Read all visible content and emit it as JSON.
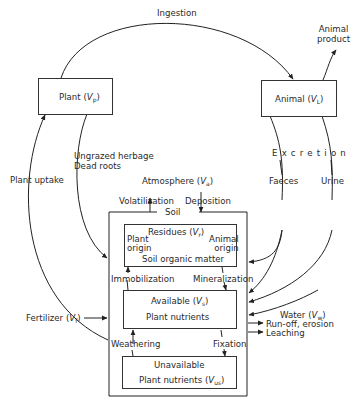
{
  "diagram": {
    "nodes": {
      "plant": {
        "label": "Plant",
        "symbol": "V",
        "subscript": "p"
      },
      "animal": {
        "label": "Animal",
        "symbol": "V",
        "subscript": "L"
      },
      "atmosphere": {
        "label": "Atmosphere",
        "symbol": "V",
        "subscript": "a"
      },
      "soil": {
        "label": "Soil"
      },
      "residues": {
        "label": "Residues",
        "symbol": "V",
        "subscript": "r",
        "plant_origin_1": "Plant",
        "plant_origin_2": "origin",
        "animal_origin_1": "Animal",
        "animal_origin_2": "origin",
        "soil_organic_matter": "Soil organic matter"
      },
      "available": {
        "label": "Available",
        "symbol": "V",
        "subscript": "s",
        "line2": "Plant nutrients"
      },
      "unavailable": {
        "label": "Unavailable",
        "line2": "Plant nutrients",
        "symbol": "V",
        "subscript": "us"
      },
      "fertilizer": {
        "label": "Fertilizer",
        "symbol": "V",
        "subscript": "f"
      },
      "water": {
        "label": "Water",
        "symbol": "V",
        "subscript": "w"
      },
      "animal_product": {
        "line1": "Animal",
        "line2": "product"
      }
    },
    "flows": {
      "ingestion": "Ingestion",
      "plant_uptake": "Plant uptake",
      "ungrazed_herbage": "Ungrazed herbage",
      "dead_roots": "Dead roots",
      "volatilization": "Volatilization",
      "deposition": "Deposition",
      "excretion": "Excretion",
      "faeces": "Faeces",
      "urine": "Urine",
      "immobilization": "Immobilization",
      "mineralization": "Mineralization",
      "weathering": "Weathering",
      "fixation": "Fixation",
      "runoff": "Run-off, erosion",
      "leaching": "Leaching"
    },
    "colors": {
      "line": "#222222",
      "background": "#ffffff"
    }
  }
}
